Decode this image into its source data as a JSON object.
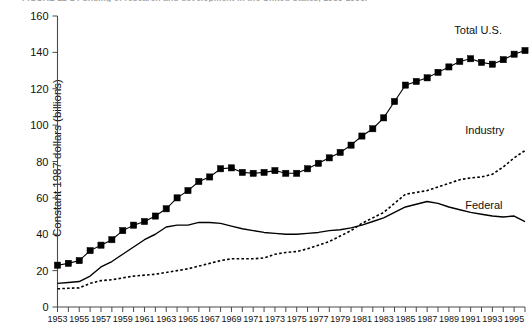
{
  "figure": {
    "caption": "FIGURE 12-1  Funding of research and development in the United States, 1953-1996."
  },
  "chart_data": {
    "type": "line",
    "title": "",
    "xlabel": "",
    "ylabel": "Constant 1987 dollars (billions)",
    "xlim": [
      1953,
      1996
    ],
    "ylim": [
      0,
      160
    ],
    "yticks": [
      0,
      20,
      40,
      60,
      80,
      100,
      120,
      140,
      160
    ],
    "ytick_labels": [
      "0",
      "20",
      "40",
      "60",
      "80",
      "100",
      "120",
      "140",
      "160"
    ],
    "x_minor_tick_every": 1,
    "x_label_every": 2,
    "xtick_labels": [
      "1953",
      "1955",
      "1957",
      "1959",
      "1961",
      "1963",
      "1965",
      "1967",
      "1969",
      "1971",
      "1973",
      "1975",
      "1977",
      "1979",
      "1981",
      "1983",
      "1985",
      "1987",
      "1989",
      "1991",
      "1993",
      "1995"
    ],
    "grid": false,
    "legend_position": "inline-right",
    "x": [
      1953,
      1954,
      1955,
      1956,
      1957,
      1958,
      1959,
      1960,
      1961,
      1962,
      1963,
      1964,
      1965,
      1966,
      1967,
      1968,
      1969,
      1970,
      1971,
      1972,
      1973,
      1974,
      1975,
      1976,
      1977,
      1978,
      1979,
      1980,
      1981,
      1982,
      1983,
      1984,
      1985,
      1986,
      1987,
      1988,
      1989,
      1990,
      1991,
      1992,
      1993,
      1994,
      1995,
      1996
    ],
    "series": [
      {
        "name": "Total U.S.",
        "style": "line-markers",
        "marker": "square",
        "label_x": 1989.5,
        "label_y": 150,
        "values": [
          23,
          24,
          25.5,
          31,
          34,
          37,
          42,
          45,
          47,
          50,
          54,
          60,
          64,
          69,
          71.5,
          76,
          76.5,
          74,
          73.5,
          74,
          75,
          73.5,
          73.5,
          76,
          79,
          82,
          85,
          89,
          94,
          98,
          104,
          113,
          122,
          124,
          126,
          129,
          132,
          135,
          136.5,
          134.5,
          133.5,
          136,
          139,
          141
        ],
        "units": "billions of constant 1987 dollars"
      },
      {
        "name": "Industry",
        "style": "dashed",
        "label_x": 1990.5,
        "label_y": 95,
        "values": [
          10,
          10.3,
          10.5,
          13,
          14.5,
          15,
          16,
          17,
          17.5,
          18,
          19,
          20,
          21,
          22.5,
          24,
          25.5,
          26.5,
          26.5,
          26.5,
          27,
          29,
          30,
          30.5,
          32,
          34,
          36,
          39,
          42,
          46,
          49,
          52,
          57,
          62,
          63,
          64,
          66,
          68,
          70,
          71,
          71.5,
          73,
          77,
          82,
          86
        ],
        "units": "billions of constant 1987 dollars"
      },
      {
        "name": "Federal",
        "style": "solid",
        "label_x": 1990.5,
        "label_y": 54,
        "values": [
          13,
          13.5,
          14,
          17,
          22,
          25,
          29,
          33,
          37,
          40,
          44,
          45,
          45,
          46.5,
          46.5,
          46,
          44.5,
          43,
          42,
          41,
          40.5,
          40,
          40,
          40.5,
          41,
          42,
          42.5,
          43.5,
          45,
          47,
          49,
          52,
          55,
          56.5,
          58,
          57,
          55,
          53.5,
          52,
          51,
          50,
          49.5,
          50,
          47
        ],
        "units": "billions of constant 1987 dollars"
      }
    ]
  }
}
